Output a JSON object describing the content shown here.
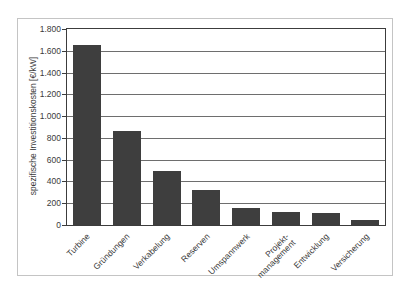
{
  "chart_data": {
    "type": "bar",
    "title": "",
    "xlabel": "",
    "ylabel": "spezifische Investitionskosten [€/kW]",
    "categories": [
      "Turbine",
      "Gründungen",
      "Verkabelung",
      "Reserven",
      "Umspannwerk",
      "Projekt-\nmanagement",
      "Entwicklung",
      "Versicherung"
    ],
    "values": [
      1650,
      860,
      500,
      320,
      160,
      120,
      110,
      50
    ],
    "ylim": [
      0,
      1800
    ],
    "ytick_step": 200,
    "ytick_labels": [
      "0",
      "200",
      "400",
      "600",
      "800",
      "1.000",
      "1.200",
      "1.400",
      "1.600",
      "1.800"
    ],
    "grid": "horizontal",
    "legend_position": "none"
  },
  "colors": {
    "bar": "#3e3e3e",
    "gridline": "#6e6e6e",
    "plot_border": "#3c3c3c",
    "frame_border": "#c4c4c4",
    "text": "#3a3a3a",
    "background": "#ffffff"
  }
}
